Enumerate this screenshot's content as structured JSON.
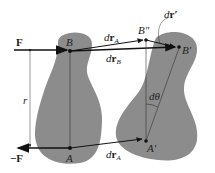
{
  "diagram": {
    "colors": {
      "body_fill": "#8c8c8c",
      "line": "#111111",
      "thin_line": "#333333",
      "background": "#ffffff"
    },
    "labels": {
      "force_top": "F",
      "force_bottom": "−F",
      "point_B": "B",
      "point_A": "A",
      "point_B_double_prime": "B″",
      "point_B_prime": "B′",
      "point_A_prime": "A′",
      "distance_r": "r",
      "dr_A_top_d": "d",
      "dr_A_top_r": "r",
      "dr_A_top_sub": "A",
      "dr_B_d": "d",
      "dr_B_r": "r",
      "dr_B_sub": "B",
      "dr_prime_d": "d",
      "dr_prime_r": "r′",
      "dtheta": "dθ",
      "dr_A_bottom_d": "d",
      "dr_A_bottom_r": "r",
      "dr_A_bottom_sub": "A"
    }
  }
}
